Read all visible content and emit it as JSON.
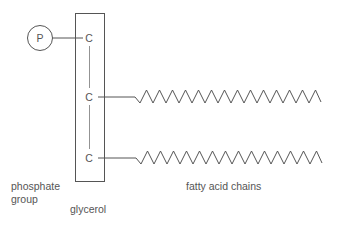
{
  "diagram": {
    "title": "",
    "phosphate": {
      "symbol": "P"
    },
    "glycerol_carbons": [
      "C",
      "C",
      "C"
    ],
    "labels": {
      "phosphate_line1": "phosphate",
      "phosphate_line2": "group",
      "glycerol": "glycerol",
      "fatty_acids": "fatty acid chains"
    },
    "colors": {
      "stroke": "#555555",
      "background": "#ffffff"
    }
  }
}
